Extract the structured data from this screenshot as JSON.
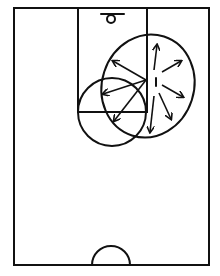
{
  "diagram": {
    "type": "basketball-half-court",
    "colors": {
      "background": "#ffffff",
      "stroke": "#111111"
    },
    "court": {
      "left": 14,
      "top": 8,
      "right": 209,
      "bottom": 265
    },
    "lane": {
      "left": 78,
      "right": 147,
      "top": 8,
      "free_throw_y": 112
    },
    "hoop": {
      "cx": 111,
      "cy": 19,
      "r": 4,
      "backboard": {
        "x1": 101,
        "x2": 124,
        "y": 14
      }
    },
    "free_throw_circle": {
      "cx": 112,
      "cy": 112,
      "r": 34
    },
    "center_circle": {
      "cx": 111,
      "cy": 265,
      "r": 19
    },
    "coverage_ellipse": {
      "cx": 148,
      "cy": 86,
      "rx": 46,
      "ry": 52,
      "rotate": 18
    },
    "player_marker": {
      "x": 156,
      "y1": 78,
      "y2": 86
    },
    "origin": {
      "x": 146,
      "y": 80
    },
    "arrows": [
      {
        "x1": 146,
        "y1": 80,
        "x2": 113,
        "y2": 61
      },
      {
        "x1": 146,
        "y1": 80,
        "x2": 103,
        "y2": 94
      },
      {
        "x1": 146,
        "y1": 80,
        "x2": 114,
        "y2": 121
      },
      {
        "x1": 154,
        "y1": 70,
        "x2": 157,
        "y2": 45
      },
      {
        "x1": 162,
        "y1": 72,
        "x2": 181,
        "y2": 61
      },
      {
        "x1": 162,
        "y1": 85,
        "x2": 183,
        "y2": 97
      },
      {
        "x1": 159,
        "y1": 93,
        "x2": 171,
        "y2": 119
      },
      {
        "x1": 154,
        "y1": 96,
        "x2": 150,
        "y2": 132
      }
    ]
  }
}
